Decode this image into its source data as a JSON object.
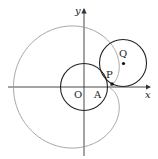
{
  "diagram": {
    "type": "geometry",
    "axes": {
      "x_label": "x",
      "y_label": "y"
    },
    "points": [
      {
        "name": "O",
        "label": "O"
      },
      {
        "name": "A",
        "label": "A"
      },
      {
        "name": "P",
        "label": "P"
      },
      {
        "name": "Q",
        "label": "Q"
      }
    ],
    "colors": {
      "circle": "#222222",
      "cardioid": "#999999",
      "axis": "#333333"
    }
  }
}
